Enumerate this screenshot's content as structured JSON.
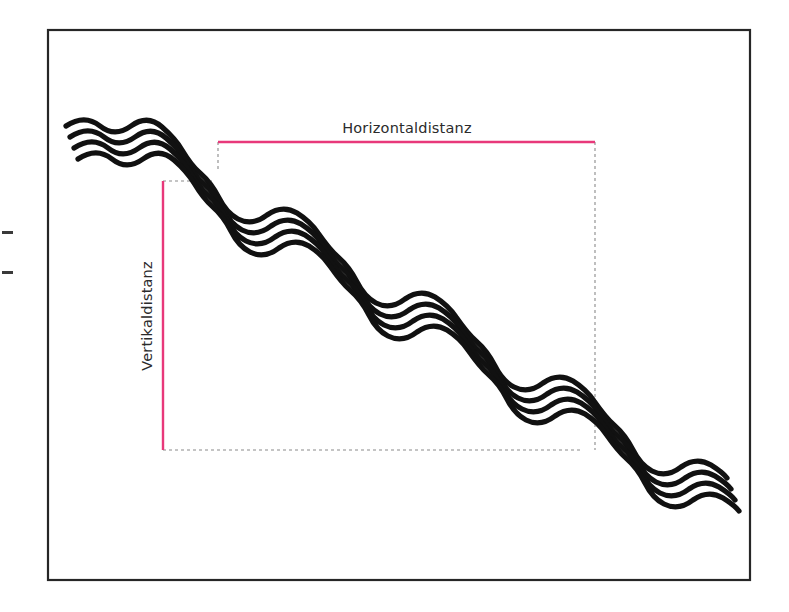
{
  "figure": {
    "kind": "technical-diagram",
    "language": "de",
    "background_color": "#ffffff",
    "frame": {
      "name": "figure-border",
      "x": 48,
      "y": 30,
      "width": 702,
      "height": 550,
      "stroke_color": "#262626",
      "stroke_width": 2.2,
      "fill": "#ffffff"
    },
    "labels": {
      "horizontal": "Horizontaldistanz",
      "vertical": "Vertikaldistanz"
    },
    "measure_color": "#E8387A",
    "guide_color": "#8a8a8a",
    "terrain_color": "#111111",
    "crop_marks": [
      {
        "x": 2,
        "y": 231,
        "width": 11,
        "height": 3
      },
      {
        "x": 2,
        "y": 271,
        "width": 11,
        "height": 3
      }
    ],
    "measures": {
      "horizontal_line": {
        "x1": 218,
        "y1": 142,
        "x2": 595,
        "y2": 142,
        "stroke_width": 2.4
      },
      "vertical_line": {
        "x1": 163,
        "y1": 181,
        "x2": 163,
        "y2": 450,
        "stroke_width": 2.4
      }
    },
    "guides": {
      "dash_pattern": "3,3",
      "stroke_width": 1.1,
      "segments": [
        {
          "name": "guide-top-left-stub",
          "x1": 163,
          "y1": 181,
          "x2": 212,
          "y2": 181
        },
        {
          "name": "guide-right-vertical",
          "x1": 218,
          "y1": 142,
          "x2": 218,
          "y2": 168
        },
        {
          "name": "guide-far-right-vertical",
          "x1": 595,
          "y1": 142,
          "x2": 595,
          "y2": 450
        },
        {
          "name": "guide-bottom-horizontal",
          "x1": 163,
          "y1": 450,
          "x2": 582,
          "y2": 450
        }
      ]
    },
    "terrain": {
      "name": "wavy-terrain-line",
      "stroke_count": 4,
      "stroke_width": 5.2,
      "offsets": [
        0,
        11,
        22,
        33
      ],
      "path_start": {
        "x": 66,
        "y": 126
      },
      "path_end": {
        "x": 727,
        "y": 456
      },
      "description": "four parallel wavy strokes forming a descending staircase profile",
      "path": "M 66 126 C 78 118 90 118 100 126 C 110 134 120 134 131 126 C 142 118 152 118 162 127 C 170 134 176 140 182 150 C 188 160 193 167 200 173 C 208 180 214 188 219 198 C 224 208 230 215 238 219 C 248 224 258 222 267 215 C 277 208 287 207 297 213 C 305 218 312 224 318 233 C 325 243 331 251 338 257 C 346 264 352 272 357 282 C 362 292 368 299 376 303 C 386 308 396 306 405 299 C 415 292 425 291 435 297 C 443 302 450 308 456 317 C 463 327 469 335 476 341 C 484 348 490 356 495 366 C 500 376 506 383 514 387 C 524 392 534 390 543 383 C 553 376 563 375 573 381 C 581 386 588 392 594 401 C 601 411 607 419 614 425 C 622 432 628 440 633 450 C 638 460 644 467 652 471 C 662 476 672 474 681 467 C 691 460 701 459 711 465 C 719 470 724 474 727 478"
    }
  }
}
